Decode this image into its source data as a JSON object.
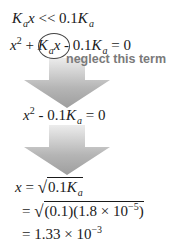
{
  "equations": {
    "line1": {
      "lhs_K": "K",
      "lhs_sub": "a",
      "lhs_x": "x",
      "op": "<<",
      "rhs_num": "0.1",
      "rhs_K": "K",
      "rhs_sub": "a"
    },
    "line2": {
      "x": "x",
      "exp": "2",
      "plus": "+",
      "K": "K",
      "sub": "a",
      "kx": "x",
      "minus": "-",
      "num": "0.1",
      "K2": "K",
      "sub2": "a",
      "eq": "=",
      "zero": "0"
    },
    "annotation": "neglect this term",
    "line3": {
      "x": "x",
      "exp": "2",
      "minus": "-",
      "num": "0.1",
      "K": "K",
      "sub": "a",
      "eq": "=",
      "zero": "0"
    },
    "line4": {
      "x": "x",
      "eq": "=",
      "sqrt": "√",
      "num": "0.1",
      "K": "K",
      "sub": "a"
    },
    "line5": {
      "eq": "=",
      "sqrt": "√",
      "inner": "(0.1)(1.8 × 10",
      "exp": "−5",
      "close": ")"
    },
    "line6": {
      "eq": "=",
      "val": "1.33 × 10",
      "exp": "−3"
    }
  },
  "colors": {
    "arrow_top": "#a9a9a9",
    "arrow_bottom": "#e8e8e8",
    "text": "#1a1a1a",
    "annotation": "#7a7a7a"
  }
}
